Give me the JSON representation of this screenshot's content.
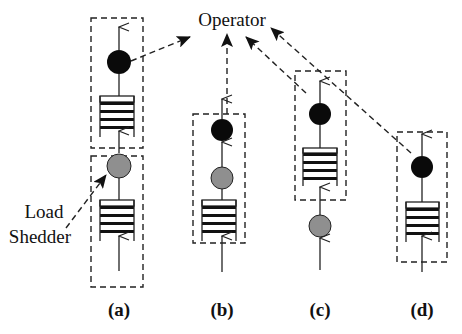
{
  "diagram": {
    "operator_label": "Operator",
    "load_shedder_label_line1": "Load",
    "load_shedder_label_line2": "Shedder",
    "colors": {
      "operator_node": "#0a0a0a",
      "load_shedder_node": "#8f8f8f",
      "stroke": "#222222",
      "background": "#ffffff"
    },
    "panels": [
      {
        "id": "a",
        "caption": "(a)",
        "description": "Load shedder placed before its own queue, separate from operator box",
        "stack_bottom_to_top": [
          "input",
          "queue",
          "load-shedder",
          "queue",
          "operator"
        ]
      },
      {
        "id": "b",
        "caption": "(b)",
        "description": "Load shedder inside operator box between queue and operator",
        "stack_bottom_to_top": [
          "input",
          "queue",
          "load-shedder",
          "operator"
        ]
      },
      {
        "id": "c",
        "caption": "(c)",
        "description": "Load shedder before operator box input",
        "stack_bottom_to_top": [
          "input",
          "load-shedder",
          "queue",
          "operator"
        ]
      },
      {
        "id": "d",
        "caption": "(d)",
        "description": "No load shedder",
        "stack_bottom_to_top": [
          "input",
          "queue",
          "operator"
        ]
      }
    ]
  }
}
